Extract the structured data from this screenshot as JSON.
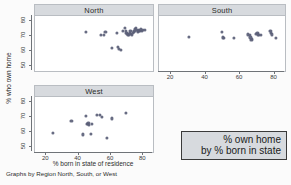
{
  "chart_data": {
    "type": "scatter",
    "title": "",
    "xlabel": "% born in state of residence",
    "ylabel": "% who own home",
    "note": "Graphs by Region North, South, or West",
    "annotation": {
      "line1": "% own home",
      "line2": "by % born in state"
    },
    "xlim": [
      13,
      86
    ],
    "ylim": [
      47,
      83
    ],
    "xticks": [
      20,
      40,
      60,
      80
    ],
    "yticks": [
      50,
      60,
      70,
      80
    ],
    "grid": false,
    "legend": "none",
    "marker_color": "#5b5f78",
    "panel_header_color": "#d7dade",
    "panels": [
      {
        "label": "North",
        "x": [
          44.5,
          54.0,
          55.5,
          56.5,
          60.5,
          63.5,
          64.5,
          65.0,
          66.0,
          67.5,
          68.5,
          69.0,
          69.5,
          70.0,
          70.5,
          71.0,
          71.5,
          72.0,
          72.5,
          73.0,
          73.5,
          74.0,
          74.5,
          75.0,
          75.5,
          76.0,
          76.5,
          77.0,
          77.5,
          78.0,
          78.5,
          79.0,
          80.0,
          81.0
        ],
        "y": [
          72.5,
          70.5,
          70.8,
          72.6,
          62.0,
          71.8,
          63.0,
          61.5,
          60.8,
          73.5,
          75.0,
          73.2,
          72.0,
          71.5,
          71.0,
          70.8,
          72.2,
          73.0,
          71.2,
          70.5,
          71.8,
          72.5,
          73.5,
          74.5,
          75.2,
          73.8,
          72.8,
          73.2,
          74.0,
          73.5,
          74.2,
          73.0,
          73.8,
          74.0
        ]
      },
      {
        "label": "South",
        "x": [
          30.5,
          49.5,
          50.0,
          50.5,
          56.5,
          64.5,
          65.5,
          66.0,
          66.5,
          67.0,
          69.0,
          70.0,
          70.5,
          71.0,
          72.0,
          77.5,
          78.0,
          78.5,
          80.5
        ],
        "y": [
          69.5,
          72.5,
          69.0,
          68.8,
          68.5,
          71.0,
          70.8,
          69.0,
          67.5,
          68.0,
          71.5,
          71.8,
          71.0,
          70.5,
          70.8,
          73.5,
          72.0,
          71.0,
          68.8
        ]
      },
      {
        "label": "West",
        "x": [
          24.0,
          35.5,
          42.5,
          44.5,
          45.0,
          45.5,
          46.0,
          46.5,
          47.5,
          48.0,
          51.5,
          53.0,
          54.5,
          57.5,
          60.5,
          69.0
        ],
        "y": [
          59.5,
          67.5,
          58.5,
          70.8,
          65.5,
          65.2,
          65.8,
          65.0,
          58.8,
          65.3,
          71.5,
          71.2,
          69.8,
          56.0,
          69.0,
          72.5
        ]
      }
    ]
  }
}
